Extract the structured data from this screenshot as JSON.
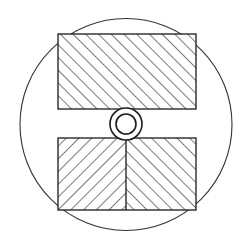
{
  "figure": {
    "background_color": "#ffffff",
    "stroke_color": "#1a1a1a",
    "hatch_color": "#1a1a1a",
    "canvas": {
      "width": 248,
      "height": 249
    }
  },
  "outer_circle": {
    "name": "outer boundary circle",
    "cx": 126,
    "cy": 124.5,
    "r": 106,
    "stroke_width": 1.1,
    "fill": "none"
  },
  "upper_block": {
    "name": "upper hatched rectangle",
    "x": 58,
    "y": 34,
    "width": 138,
    "height": 75,
    "hatch_direction": "ascending",
    "hatch_angle_deg": 45,
    "hatch_spacing": 9,
    "stroke_width": 1.3,
    "fill": "#ffffff"
  },
  "lower_block": {
    "name": "lower hatched rectangle",
    "x": 58,
    "y": 138,
    "width": 138,
    "height": 72,
    "stroke_width": 1.3,
    "fill": "#ffffff",
    "divider_x": 126,
    "left_half_hatch_direction": "descending",
    "right_half_hatch_direction": "ascending",
    "hatch_angle_deg": 45,
    "hatch_spacing": 9
  },
  "center_bore": {
    "name": "central double circle bore",
    "cx": 126,
    "cy": 124,
    "outer_r": 16,
    "inner_r": 10,
    "stroke_width": 1.6,
    "fill": "#ffffff"
  },
  "caption": {
    "text": ""
  }
}
